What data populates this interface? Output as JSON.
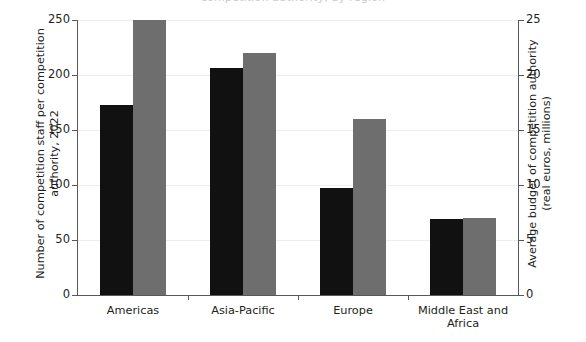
{
  "title_sliver": "competition authority, by region",
  "chart_data": {
    "type": "bar",
    "title": "",
    "categories": [
      "Americas",
      "Asia-Pacific",
      "Europe",
      "Middle East and\nAfrica"
    ],
    "series": [
      {
        "name": "Number of competition staff per competition authority, 2022",
        "axis": "left",
        "color": "#111111",
        "values": [
          173,
          206,
          97,
          69
        ]
      },
      {
        "name": "Average budget of competition authority (real euros, millions)",
        "axis": "right",
        "color": "#6e6e6e",
        "values": [
          25.0,
          22.0,
          16.0,
          7.0
        ]
      }
    ],
    "left_axis": {
      "label": "Number of competition staff per competition\nauthority, 2022",
      "ticks": [
        0,
        50,
        100,
        150,
        200,
        250
      ],
      "ylim": [
        0,
        250
      ]
    },
    "right_axis": {
      "label": "Average budget of competition authority\n(real euros, millions)",
      "ticks": [
        0,
        5,
        10,
        15,
        20,
        25
      ],
      "ylim": [
        0,
        25
      ]
    },
    "xlabel": "",
    "grid": true,
    "legend": "none"
  }
}
